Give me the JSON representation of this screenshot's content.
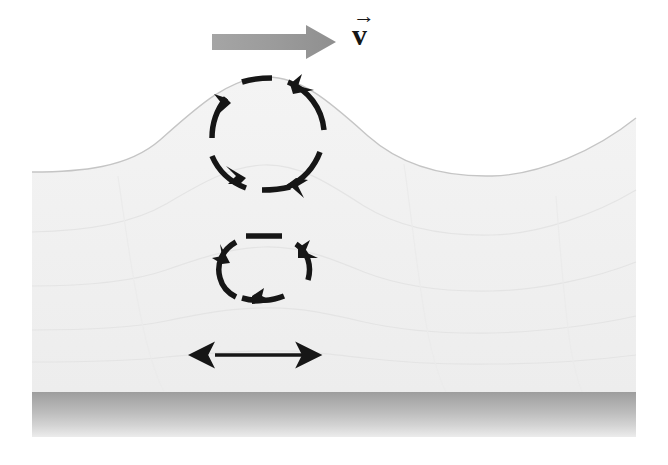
{
  "figure": {
    "canvas": {
      "width": 668,
      "height": 465
    },
    "background_color": "#ffffff"
  },
  "labels": {
    "velocity_vector": "v",
    "velocity_vector_accent": "→"
  },
  "colors": {
    "water_fill": "#f1f1f1",
    "water_outline": "#c9c9c9",
    "seabed_top": "#a2a2a2",
    "seabed_bottom": "#e8e8e8",
    "arrow_gray": "#9b9b9b",
    "ink_black": "#161616",
    "interior_contour": "#e6e6e6"
  },
  "elements": {
    "propagation_arrow": {
      "name": "wave propagation direction arrow",
      "direction": "right",
      "x_start": 212,
      "x_end": 334,
      "y": 42,
      "color": "#9b9b9b"
    },
    "water_surface": {
      "name": "wave surface profile",
      "crest_x": 265,
      "crest_y": 77,
      "left_trough_x": 60,
      "left_trough_y": 172,
      "right_trough_x": 492,
      "right_trough_y": 176,
      "left_edge_x": 32,
      "right_edge_x": 636
    },
    "seabed": {
      "name": "sea floor band",
      "top_y": 392,
      "bottom_y": 437,
      "left_x": 32,
      "right_x": 636
    },
    "upper_orbit": {
      "name": "large circular orbit near surface",
      "center_x": 268,
      "center_y": 134,
      "radius_x": 56,
      "radius_y": 55,
      "rotation": "clockwise",
      "style": "dashed arcs with arrowheads",
      "segments": 4
    },
    "middle_orbit": {
      "name": "smaller elliptical orbit at depth",
      "center_x": 264,
      "center_y": 269,
      "radius_x": 48,
      "radius_y": 34,
      "rotation": "clockwise",
      "style": "dashed arcs with arrowheads",
      "segments": 4
    },
    "bottom_oscillation": {
      "name": "horizontal back-and-forth double arrow near seabed",
      "center_x": 258,
      "y": 355,
      "half_length": 47,
      "direction": "bidirectional-horizontal"
    }
  }
}
